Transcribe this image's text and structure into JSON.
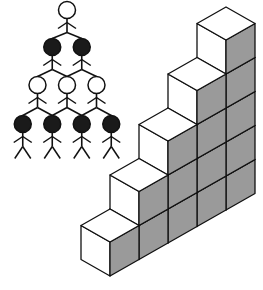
{
  "figure": {
    "pyramid": {
      "rows": [
        {
          "count": 1,
          "fill": "white"
        },
        {
          "count": 2,
          "fill": "black"
        },
        {
          "count": 3,
          "fill": "white"
        },
        {
          "count": 4,
          "fill": "black"
        }
      ]
    },
    "staircase": {
      "columns": 5,
      "column_heights": [
        1,
        2,
        3,
        4,
        5
      ],
      "colors": {
        "top_face": "#ffffff",
        "left_face": "#ffffff",
        "right_face": "#9a9a9a",
        "stroke": "#111111"
      }
    }
  }
}
